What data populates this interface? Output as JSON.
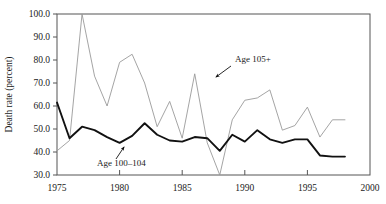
{
  "chart_data": {
    "type": "line",
    "title": "",
    "xlabel": "",
    "ylabel": "Death rate (percent)",
    "xlim": [
      1975,
      2000
    ],
    "ylim": [
      30.0,
      100.0
    ],
    "xticks": [
      1975,
      1980,
      1985,
      1990,
      1995,
      2000
    ],
    "xtick_labels": [
      "1975",
      "1980",
      "1985",
      "1990",
      "1995",
      "2000"
    ],
    "yticks": [
      30.0,
      40.0,
      50.0,
      60.0,
      70.0,
      80.0,
      90.0,
      100.0
    ],
    "ytick_labels": [
      "30.0",
      "40.0",
      "50.0",
      "60.0",
      "70.0",
      "80.0",
      "90.0",
      "100.0"
    ],
    "grid": false,
    "legend_position": "inline-annotations",
    "x": [
      1975,
      1976,
      1977,
      1978,
      1979,
      1980,
      1981,
      1982,
      1983,
      1984,
      1985,
      1986,
      1987,
      1988,
      1989,
      1990,
      1991,
      1992,
      1993,
      1994,
      1995,
      1996,
      1997,
      1998
    ],
    "series": [
      {
        "name": "Age 105+",
        "color": "#9a9a9a",
        "style": "thin",
        "annotation": "Age 105+",
        "values": [
          40.5,
          45.0,
          100.0,
          73.0,
          60.0,
          79.0,
          82.5,
          70.0,
          51.0,
          62.0,
          46.0,
          74.0,
          44.0,
          30.0,
          54.0,
          62.5,
          63.5,
          67.0,
          49.5,
          51.5,
          59.5,
          46.5,
          54.0,
          54.0
        ]
      },
      {
        "name": "Age 100-104",
        "color": "#111111",
        "style": "thick",
        "annotation": "Age 100–104",
        "values": [
          61.5,
          46.0,
          51.0,
          49.5,
          46.5,
          44.0,
          47.0,
          52.5,
          47.5,
          45.0,
          44.5,
          46.5,
          46.0,
          40.5,
          47.5,
          44.5,
          49.5,
          45.5,
          44.0,
          45.5,
          45.5,
          38.5,
          38.0,
          38.0
        ]
      }
    ],
    "annotations": [
      {
        "text": "Age 105+",
        "name": "annotation-age-105-plus",
        "label_x": 235,
        "label_y": 62,
        "arrow_from_x": 231,
        "arrow_from_y": 66,
        "arrow_to_x": 216,
        "arrow_to_y": 77
      },
      {
        "text": "Age 100–104",
        "name": "annotation-age-100-104",
        "label_x": 97,
        "label_y": 166,
        "arrow_from_x": 116,
        "arrow_from_y": 159,
        "arrow_to_x": 124,
        "arrow_to_y": 147
      }
    ]
  }
}
